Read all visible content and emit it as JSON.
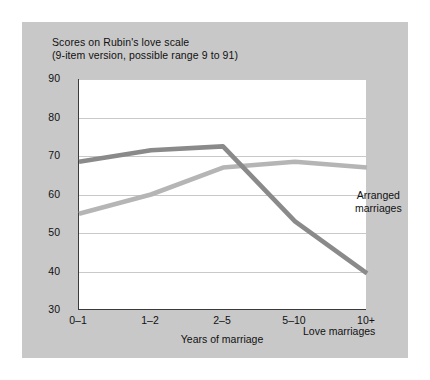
{
  "figure": {
    "background_color": "#c8c8c8",
    "plot_background_color": "#ffffff",
    "axis_color": "#3a3a3a",
    "gridline_color": "#c9c9c9"
  },
  "chart_data": {
    "type": "line",
    "title": "Scores on Rubin's love scale (9-item version, possible range 9 to 91)",
    "title_lines": [
      "Scores on Rubin's love scale",
      "(9-item version, possible range 9 to 91)"
    ],
    "xlabel": "Years of marriage",
    "ylabel": "",
    "categories": [
      "0–1",
      "1–2",
      "2–5",
      "5–10",
      "10+"
    ],
    "ylim": [
      30,
      90
    ],
    "yticks": [
      30,
      40,
      50,
      60,
      70,
      80,
      90
    ],
    "ytick_labels": [
      "30",
      "40",
      "50",
      "60",
      "70",
      "80",
      "90"
    ],
    "grid": true,
    "legend": "inline-annotations",
    "series": [
      {
        "name": "Love marriages",
        "color": "#8a8a8a",
        "values": [
          68.5,
          71.5,
          72.5,
          53.0,
          39.5
        ],
        "label_position": "below-right"
      },
      {
        "name": "Arranged marriages",
        "color": "#b5b5b5",
        "values": [
          55.0,
          60.0,
          67.0,
          68.5,
          67.0
        ],
        "label_position": "above-right"
      }
    ],
    "annotations": [
      {
        "text": "Arranged",
        "line2": "marriages",
        "series": "Arranged marriages"
      },
      {
        "text": "Love marriages",
        "series": "Love marriages"
      }
    ]
  }
}
